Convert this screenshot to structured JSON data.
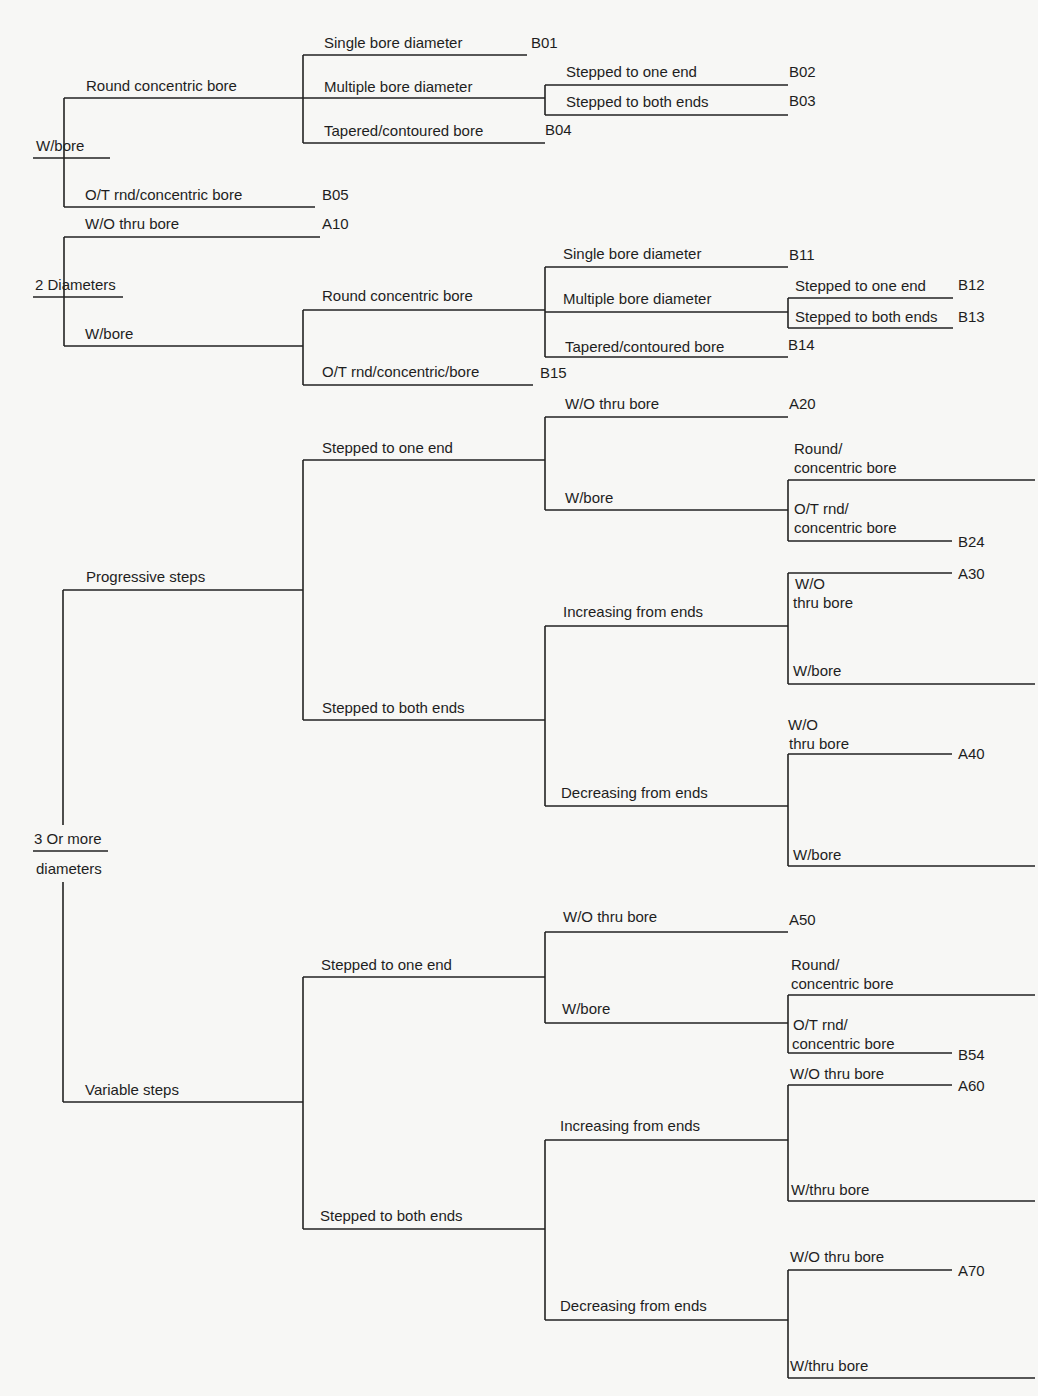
{
  "diagram": {
    "title_visible": "",
    "roots": {
      "wbore": "W/bore",
      "two_diam": "2 Diameters",
      "three_top": "3 Or more",
      "three_bottom": "diameters"
    },
    "wbore_group": {
      "round_concentric": "Round concentric bore",
      "single_bore": "Single bore diameter",
      "b01": "B01",
      "multiple_bore": "Multiple bore diameter",
      "stepped_one": "Stepped to one end",
      "b02": "B02",
      "stepped_both": "Stepped to both ends",
      "b03": "B03",
      "tapered": "Tapered/contoured bore",
      "b04": "B04",
      "ot_rnd": "O/T rnd/concentric bore",
      "b05": "B05"
    },
    "two_group": {
      "wo_thru": "W/O thru bore",
      "a10": "A10",
      "wbore": "W/bore",
      "round_concentric": "Round concentric bore",
      "single_bore": "Single bore diameter",
      "b11": "B11",
      "multiple_bore": "Multiple bore diameter",
      "stepped_one": "Stepped to one end",
      "b12": "B12",
      "stepped_both": "Stepped to both ends",
      "b13": "B13",
      "tapered": "Tapered/contoured bore",
      "b14": "B14",
      "ot_rnd": "O/T rnd/concentric/bore",
      "b15": "B15"
    },
    "progressive": {
      "label": "Progressive steps",
      "one_end": "Stepped to one end",
      "wo_thru": "W/O thru bore",
      "a20": "A20",
      "wbore": "W/bore",
      "round_line1": "Round/",
      "round_line2": "concentric bore",
      "ot_line1": "O/T rnd/",
      "ot_line2": "concentric bore",
      "b24": "B24",
      "both_ends": "Stepped to both ends",
      "increasing": "Increasing from ends",
      "inc_wo_line1": "W/O",
      "inc_wo_line2": "thru bore",
      "a30": "A30",
      "inc_wbore": "W/bore",
      "decreasing": "Decreasing from ends",
      "dec_wo_line1": "W/O",
      "dec_wo_line2": "thru bore",
      "a40": "A40",
      "dec_wbore": "W/bore"
    },
    "variable": {
      "label": "Variable steps",
      "one_end": "Stepped to one end",
      "wo_thru": "W/O thru bore",
      "a50": "A50",
      "wbore": "W/bore",
      "round_line1": "Round/",
      "round_line2": "concentric bore",
      "ot_line1": "O/T rnd/",
      "ot_line2": "concentric bore",
      "b54": "B54",
      "both_ends": "Stepped to both ends",
      "increasing": "Increasing from ends",
      "inc_wo": "W/O thru bore",
      "a60": "A60",
      "inc_wthru": "W/thru bore",
      "decreasing": "Decreasing from ends",
      "dec_wo": "W/O thru bore",
      "a70": "A70",
      "dec_wthru": "W/thru bore"
    }
  }
}
